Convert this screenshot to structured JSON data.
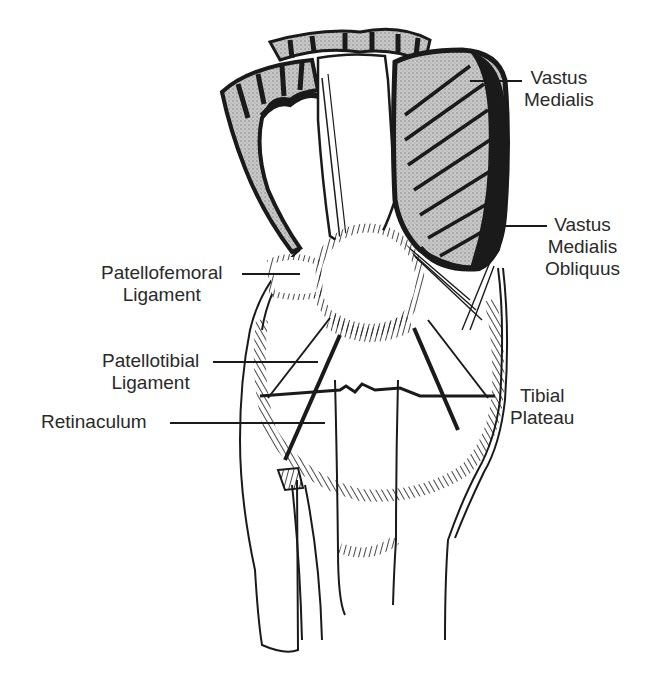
{
  "diagram": {
    "colors": {
      "ink": "#1a1a1a",
      "muscle_fill": "#b8b8b8",
      "background": "#ffffff",
      "text": "#2a2a2a"
    },
    "labels": {
      "vastus_medialis": {
        "line1": "Vastus",
        "line2": "Medialis"
      },
      "vmo": {
        "line1": "Vastus",
        "line2": "Medialis",
        "line3": "Obliquus"
      },
      "patellofemoral": {
        "line1": "Patellofemoral",
        "line2": "Ligament"
      },
      "patellotibial": {
        "line1": "Patellotibial",
        "line2": "Ligament"
      },
      "retinaculum": {
        "line1": "Retinaculum"
      },
      "tibial_plateau": {
        "line1": "Tibial",
        "line2": "Plateau"
      }
    }
  }
}
